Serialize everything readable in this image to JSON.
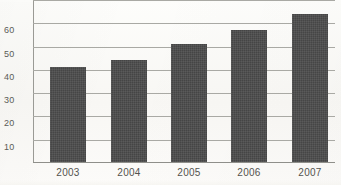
{
  "chart_data": {
    "type": "bar",
    "title": "",
    "subtitle": "",
    "xlabel": "",
    "ylabel": "",
    "categories": [
      "2003",
      "2004",
      "2005",
      "2006",
      "2007"
    ],
    "values": [
      41,
      44,
      50.5,
      56.5,
      63.5
    ],
    "series": [
      {
        "name": "",
        "values": [
          41,
          44,
          50.5,
          56.5,
          63.5
        ]
      }
    ],
    "ylim": [
      0,
      70
    ],
    "ytick_labels": [
      "10",
      "20",
      "30",
      "40",
      "50",
      "60"
    ],
    "ytick_values": [
      10,
      20,
      30,
      40,
      50,
      60
    ],
    "clipped_top_gridline_value": 70,
    "grid": true,
    "grid_orientation": "horizontal",
    "legend": false,
    "legend_position": "none",
    "annotations": [],
    "colors": {
      "bar": "#4a4a4a",
      "gridline": "#a9a9a4",
      "axis": "#8f8f8a",
      "tick_text": "#53534f",
      "background": "#fbfaf8"
    }
  }
}
